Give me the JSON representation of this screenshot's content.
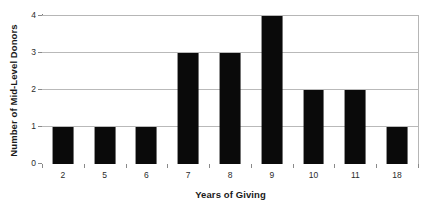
{
  "chart_data": {
    "type": "bar",
    "title": "",
    "subtitle": "",
    "xlabel": "Years of Giving",
    "ylabel": "Number of Mid-Level Donors",
    "categories": [
      "2",
      "5",
      "6",
      "7",
      "8",
      "9",
      "10",
      "11",
      "18"
    ],
    "values": [
      1,
      1,
      1,
      3,
      3,
      4,
      2,
      2,
      1
    ],
    "series": [
      {
        "name": "Mid-Level Donors",
        "values": [
          1,
          1,
          1,
          3,
          3,
          4,
          2,
          2,
          1
        ]
      }
    ],
    "y_ticks": [
      "0",
      "1",
      "2",
      "3",
      "4"
    ],
    "ylim": [
      0,
      4
    ],
    "grid": "horizontal",
    "legend": "none",
    "bar_color": "#0a0a0a",
    "gridline_color": "#b9b9b9",
    "axis_color": "#7a7a7a",
    "background_color": "#ffffff"
  }
}
